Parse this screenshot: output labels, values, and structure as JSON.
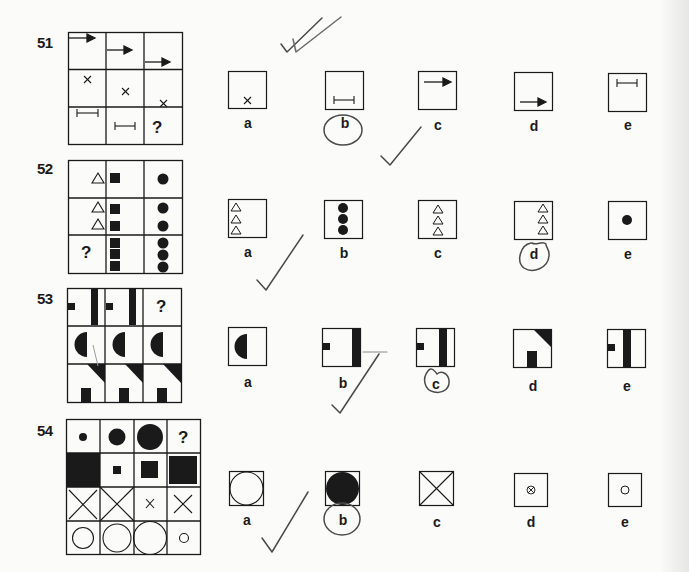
{
  "page": {
    "background": "#fbfbfa",
    "ink_color": "#1a1a1a",
    "pencil_color": "#3a3a3a"
  },
  "questions": [
    {
      "number": "51",
      "grid": {
        "rows": 3,
        "cols": 3,
        "cells": [
          [
            "arrow-top",
            "arrow-mid",
            "arrow-low"
          ],
          [
            "cross-top",
            "cross-mid",
            "cross-low"
          ],
          [
            "bar-top",
            "bar-mid",
            "?"
          ]
        ]
      },
      "question_mark": "?",
      "options": [
        {
          "label": "a",
          "content": "small cross at bottom"
        },
        {
          "label": "b",
          "content": "bar at bottom",
          "circled": true
        },
        {
          "label": "c",
          "content": "arrow at top"
        },
        {
          "label": "d",
          "content": "arrow at bottom"
        },
        {
          "label": "e",
          "content": "bar at top"
        }
      ],
      "marked_answer": "b"
    },
    {
      "number": "52",
      "grid": {
        "rows": 3,
        "cols": 3,
        "cells": [
          [
            "1 triangle",
            "1 square",
            "1 circle"
          ],
          [
            "2 triangles",
            "2 squares",
            "2 circles"
          ],
          [
            "?",
            "3 squares",
            "3 circles"
          ]
        ]
      },
      "question_mark": "?",
      "options": [
        {
          "label": "a",
          "content": "3 triangles left"
        },
        {
          "label": "b",
          "content": "3 filled circles"
        },
        {
          "label": "c",
          "content": "3 triangles center"
        },
        {
          "label": "d",
          "content": "3 triangles right",
          "circled": true
        },
        {
          "label": "e",
          "content": "1 filled circle"
        }
      ],
      "marked_answer": "d"
    },
    {
      "number": "53",
      "grid": {
        "rows": 3,
        "cols": 3,
        "cells": [
          [
            "small square + bar",
            "small square + bar",
            "?"
          ],
          [
            "half disc",
            "half disc",
            "half disc"
          ],
          [
            "corner triangle + block",
            "corner triangle + block",
            "corner triangle + block"
          ]
        ]
      },
      "question_mark": "?",
      "options": [
        {
          "label": "a",
          "content": "half disc"
        },
        {
          "label": "b",
          "content": "small square + bar right edge"
        },
        {
          "label": "c",
          "content": "small square + bar",
          "circled": true
        },
        {
          "label": "d",
          "content": "corner triangle + block"
        },
        {
          "label": "e",
          "content": "small square + bar center"
        }
      ],
      "marked_answer": "c"
    },
    {
      "number": "54",
      "grid": {
        "rows": 4,
        "cols": 4,
        "cells": [
          [
            "small dot",
            "medium disc",
            "large disc",
            "?"
          ],
          [
            "full square",
            "tiny square",
            "medium square",
            "large square"
          ],
          [
            "large X",
            "full X",
            "small x",
            "medium X"
          ],
          [
            "medium circle",
            "large circle",
            "full circle",
            "small circle"
          ]
        ]
      },
      "question_mark": "?",
      "options": [
        {
          "label": "a",
          "content": "outline circle full"
        },
        {
          "label": "b",
          "content": "filled circle full",
          "circled": true
        },
        {
          "label": "c",
          "content": "full X"
        },
        {
          "label": "d",
          "content": "tiny circled x"
        },
        {
          "label": "e",
          "content": "small circle"
        }
      ],
      "marked_answer": "b"
    }
  ]
}
